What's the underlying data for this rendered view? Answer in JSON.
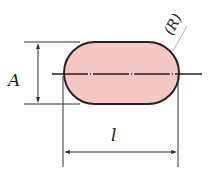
{
  "diagram": {
    "labels": {
      "height": "A",
      "length": "l",
      "radius": "(R)"
    },
    "colors": {
      "fill": "#f4c7c3",
      "outline": "#2a2022",
      "lines": "#333333",
      "background": "#ffffff"
    }
  }
}
